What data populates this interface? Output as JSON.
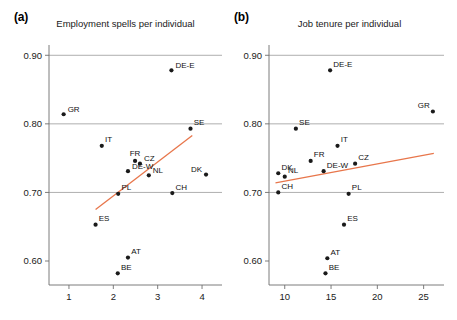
{
  "figure": {
    "background": "#ffffff",
    "axis_color": "#6e6e6e",
    "gridline_color": "#9a9a9a",
    "point_color": "#1a1a1a",
    "trend_color": "#e8764b"
  },
  "panels": [
    {
      "label": "(a)",
      "title": "Employment spells per individual"
    },
    {
      "label": "(b)",
      "title": "Job tenure per individual"
    }
  ],
  "chart_data": [
    {
      "type": "scatter",
      "panel": "(a)",
      "title": "Employment spells per individual",
      "xlabel": "",
      "ylabel": "",
      "xlim": [
        0.55,
        4.45
      ],
      "ylim": [
        0.565,
        0.915
      ],
      "xticks": [
        1,
        2,
        3,
        4
      ],
      "xtick_labels": [
        "1",
        "2",
        "3",
        "4"
      ],
      "yticks": [
        0.6,
        0.7,
        0.8,
        0.9
      ],
      "ytick_labels": [
        "0.60",
        "0.70",
        "0.80",
        "0.90"
      ],
      "grid": "horizontal gridlines at 0.70, 0.80, 0.90",
      "legend": "none",
      "point_labels": [
        "DE-E",
        "GR",
        "SE",
        "IT",
        "FR",
        "CZ",
        "DE-W",
        "NL",
        "DK",
        "PL",
        "CH",
        "ES",
        "AT",
        "BE"
      ],
      "points": [
        {
          "label": "DE-E",
          "x": 3.31,
          "y": 0.878,
          "label_pos": "right"
        },
        {
          "label": "GR",
          "x": 0.88,
          "y": 0.814,
          "label_pos": "right"
        },
        {
          "label": "SE",
          "x": 3.74,
          "y": 0.793,
          "label_pos": "above-right"
        },
        {
          "label": "IT",
          "x": 1.74,
          "y": 0.768,
          "label_pos": "above-right"
        },
        {
          "label": "FR",
          "x": 2.49,
          "y": 0.746,
          "label_pos": "above"
        },
        {
          "label": "CZ",
          "x": 2.6,
          "y": 0.742,
          "label_pos": "right"
        },
        {
          "label": "DE-W",
          "x": 2.33,
          "y": 0.731,
          "label_pos": "right"
        },
        {
          "label": "NL",
          "x": 2.8,
          "y": 0.725,
          "label_pos": "right"
        },
        {
          "label": "DK",
          "x": 4.09,
          "y": 0.726,
          "label_pos": "left"
        },
        {
          "label": "PL",
          "x": 2.11,
          "y": 0.698,
          "label_pos": "above-right"
        },
        {
          "label": "CH",
          "x": 3.33,
          "y": 0.699,
          "label_pos": "above-right"
        },
        {
          "label": "ES",
          "x": 1.6,
          "y": 0.653,
          "label_pos": "above-right"
        },
        {
          "label": "AT",
          "x": 2.33,
          "y": 0.605,
          "label_pos": "above-right"
        },
        {
          "label": "BE",
          "x": 2.1,
          "y": 0.582,
          "label_pos": "above-right"
        }
      ],
      "trendline": {
        "x0": 1.6,
        "y0": 0.675,
        "x1": 3.78,
        "y1": 0.783,
        "color": "#e8764b"
      }
    },
    {
      "type": "scatter",
      "panel": "(b)",
      "title": "Job tenure per individual",
      "xlabel": "",
      "ylabel": "",
      "xlim": [
        8.3,
        27.2
      ],
      "ylim": [
        0.565,
        0.915
      ],
      "xticks": [
        10,
        15,
        20,
        25
      ],
      "xtick_labels": [
        "10",
        "15",
        "20",
        "25"
      ],
      "yticks": [
        0.6,
        0.7,
        0.8,
        0.9
      ],
      "ytick_labels": [
        "0.60",
        "0.70",
        "0.80",
        "0.90"
      ],
      "grid": "horizontal gridlines at 0.70, 0.80, 0.90",
      "legend": "none",
      "point_labels": [
        "DE-E",
        "GR",
        "SE",
        "IT",
        "FR",
        "CZ",
        "DE-W",
        "NL",
        "DK",
        "CH",
        "PL",
        "ES",
        "AT",
        "BE"
      ],
      "points": [
        {
          "label": "DE-E",
          "x": 14.9,
          "y": 0.878,
          "label_pos": "above-right"
        },
        {
          "label": "GR",
          "x": 26.0,
          "y": 0.818,
          "label_pos": "above-left"
        },
        {
          "label": "SE",
          "x": 11.2,
          "y": 0.793,
          "label_pos": "above-right"
        },
        {
          "label": "IT",
          "x": 15.7,
          "y": 0.768,
          "label_pos": "above-right"
        },
        {
          "label": "FR",
          "x": 12.8,
          "y": 0.746,
          "label_pos": "above-right"
        },
        {
          "label": "CZ",
          "x": 17.6,
          "y": 0.742,
          "label_pos": "above-right"
        },
        {
          "label": "DE-W",
          "x": 14.2,
          "y": 0.731,
          "label_pos": "above-right"
        },
        {
          "label": "NL",
          "x": 10.0,
          "y": 0.723,
          "label_pos": "above-right"
        },
        {
          "label": "DK",
          "x": 9.3,
          "y": 0.728,
          "label_pos": "above-right"
        },
        {
          "label": "CH",
          "x": 9.3,
          "y": 0.7,
          "label_pos": "above-right"
        },
        {
          "label": "PL",
          "x": 16.9,
          "y": 0.698,
          "label_pos": "above-right"
        },
        {
          "label": "ES",
          "x": 16.4,
          "y": 0.653,
          "label_pos": "above-right"
        },
        {
          "label": "AT",
          "x": 14.6,
          "y": 0.604,
          "label_pos": "above-right"
        },
        {
          "label": "BE",
          "x": 14.4,
          "y": 0.582,
          "label_pos": "above-right"
        }
      ],
      "trendline": {
        "x0": 9.0,
        "y0": 0.714,
        "x1": 26.1,
        "y1": 0.757,
        "color": "#e8764b"
      }
    }
  ]
}
